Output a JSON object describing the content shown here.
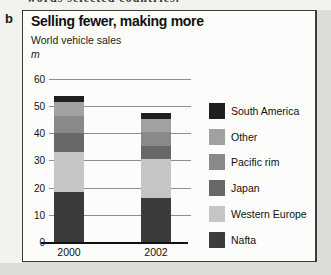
{
  "page": {
    "top_text_fragment": "words selected countries.",
    "panel_label": "b"
  },
  "chart_data": {
    "type": "bar",
    "subtype": "stacked-vertical",
    "title": "Selling fewer, making more",
    "subtitle": "World vehicle sales",
    "unit": "m",
    "categories": [
      "2000",
      "2002"
    ],
    "series": [
      {
        "name": "Nafta",
        "color": "#3b3b3b",
        "values": [
          18.5,
          16
        ]
      },
      {
        "name": "Western Europe",
        "color": "#c5c5c5",
        "values": [
          14.5,
          14.5
        ]
      },
      {
        "name": "Japan",
        "color": "#686868",
        "values": [
          7,
          5
        ]
      },
      {
        "name": "Pacific rim",
        "color": "#898989",
        "values": [
          6.5,
          5
        ]
      },
      {
        "name": "Other",
        "color": "#a1a1a1",
        "values": [
          5,
          5
        ]
      },
      {
        "name": "South America",
        "color": "#1f1f1f",
        "values": [
          2.5,
          2
        ]
      }
    ],
    "totals": [
      54,
      47.5
    ],
    "ylim": [
      0,
      60
    ],
    "ytick_step": 10,
    "yticks": [
      0,
      10,
      20,
      30,
      40,
      50,
      60
    ],
    "grid": true,
    "legend_position": "right",
    "legend_order_top_to_bottom": [
      "South America",
      "Other",
      "Pacific rim",
      "Japan",
      "Western Europe",
      "Nafta"
    ]
  }
}
